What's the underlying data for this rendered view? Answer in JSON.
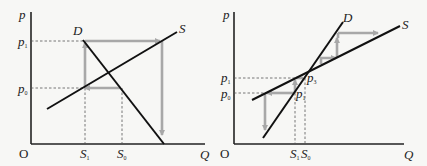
{
  "panels": [
    {
      "id": "left",
      "description": "Divergent cobweb: supply flatter than demand",
      "y_axis_label": "p",
      "x_axis_label": "Q",
      "origin_label": "O",
      "demand_label": "D",
      "supply_label": "S",
      "price_labels": [
        {
          "main": "p",
          "sub": "1"
        },
        {
          "main": "p",
          "sub": "0"
        }
      ],
      "quantity_labels": [
        {
          "main": "S",
          "sub": "1"
        },
        {
          "main": "S",
          "sub": "0"
        }
      ]
    },
    {
      "id": "right",
      "description": "Convergent cobweb: supply flatter than demand near equilibrium",
      "y_axis_label": "p",
      "x_axis_label": "Q",
      "origin_label": "O",
      "demand_label": "D",
      "supply_label": "S",
      "price_labels": [
        {
          "main": "p",
          "sub": "1"
        },
        {
          "main": "p",
          "sub": "0"
        }
      ],
      "point_labels": [
        {
          "main": "p",
          "sub": "3"
        },
        {
          "main": "p",
          "sub": "1"
        }
      ],
      "quantity_labels": [
        {
          "main": "S",
          "sub": "1"
        },
        {
          "main": "S",
          "sub": "0"
        }
      ]
    }
  ],
  "colors": {
    "curves": "#111111",
    "cobweb_path": "#a8a8a8",
    "guides": "#555555",
    "background": "#f7f7f5"
  }
}
